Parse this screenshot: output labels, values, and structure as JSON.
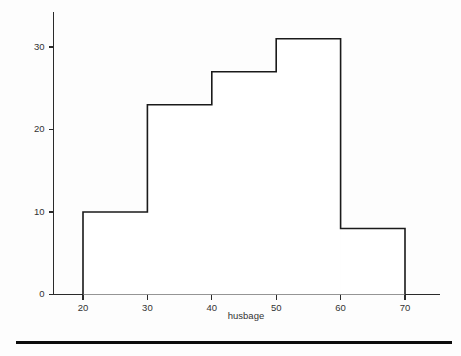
{
  "chart_data": {
    "type": "bar",
    "title": "",
    "subtitle": "",
    "xlabel": "husbage",
    "ylabel": "",
    "categories": [
      "20-30",
      "30-40",
      "40-50",
      "50-60",
      "60-70"
    ],
    "bin_edges": [
      20,
      30,
      40,
      50,
      60,
      70
    ],
    "values": [
      10,
      23,
      27,
      31,
      8
    ],
    "xlim": [
      15,
      75
    ],
    "ylim": [
      0,
      34
    ],
    "x_ticks": [
      20,
      30,
      40,
      50,
      60,
      70
    ],
    "y_ticks": [
      0,
      10,
      20,
      30
    ],
    "x_tick_labels": [
      "20",
      "30",
      "40",
      "50",
      "60",
      "70"
    ],
    "y_tick_labels": [
      "0",
      "10",
      "20",
      "30"
    ],
    "grid": false,
    "legend": null,
    "legend_position": "none",
    "bar_fill": "#ffffff",
    "bar_stroke": "#1a1a1a",
    "axis_color": "#2a2a2a",
    "background": "#fdfdfd",
    "annotations": []
  },
  "footer": {
    "rule_color": "#0c0c0c"
  }
}
